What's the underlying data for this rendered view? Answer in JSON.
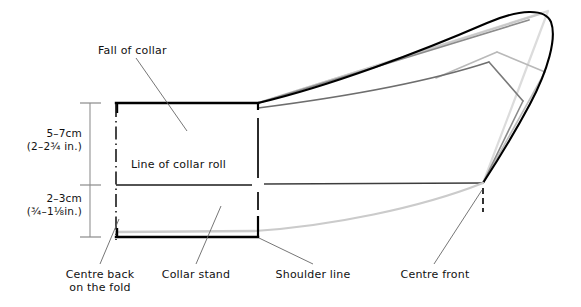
{
  "diagram": {
    "type": "technical-sewing-pattern",
    "colors": {
      "outline": "#000000",
      "mid_gray": "#4d4d4d",
      "light_gray": "#c8c8c8",
      "pale_gray": "#d9d9d9",
      "leader": "#555555",
      "text": "#111111",
      "background": "#ffffff"
    },
    "labels": {
      "fall_of_collar": "Fall of collar",
      "line_of_collar_roll": "Line of collar roll",
      "centre_back_line1": "Centre back",
      "centre_back_line2": "on the fold",
      "collar_stand": "Collar stand",
      "shoulder_line": "Shoulder line",
      "centre_front": "Centre front"
    },
    "dimensions": [
      {
        "name": "fall-depth",
        "metric": "5–7cm",
        "imperial": "(2–2¾ in.)"
      },
      {
        "name": "stand-height",
        "metric": "2–3cm",
        "imperial": "(¾–1⅛in.)"
      }
    ]
  }
}
